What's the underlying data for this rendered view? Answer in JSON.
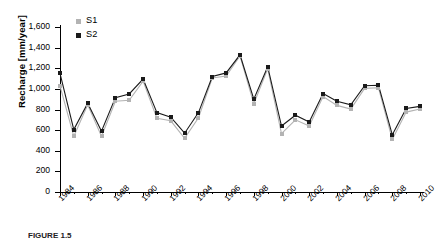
{
  "figure": {
    "y_axis_title": "Recharge [mm/year]",
    "caption": "FIGURE 1.5"
  },
  "legend": {
    "position": "top-left",
    "items": [
      {
        "label": "S1",
        "color": "#b3b3b3"
      },
      {
        "label": "S2",
        "color": "#1a1a1a"
      }
    ]
  },
  "chart_data": {
    "type": "line",
    "title": "",
    "xlabel": "",
    "ylabel": "Recharge [mm/year]",
    "ylim": [
      0,
      1600
    ],
    "yticks": [
      0,
      200,
      400,
      600,
      800,
      1000,
      1200,
      1400,
      1600
    ],
    "ytick_labels": [
      "0",
      "200",
      "400",
      "600",
      "800",
      "1,000",
      "1,200",
      "1,400",
      "1,600"
    ],
    "grid": false,
    "legend_position": "top-left",
    "x": [
      1984,
      1985,
      1986,
      1987,
      1988,
      1989,
      1990,
      1991,
      1992,
      1993,
      1994,
      1995,
      1996,
      1997,
      1998,
      1999,
      2000,
      2001,
      2002,
      2003,
      2004,
      2005,
      2006,
      2007,
      2008,
      2009,
      2010
    ],
    "xtick_labels": [
      "1984",
      "1986",
      "1988",
      "1990",
      "1992",
      "1994",
      "1996",
      "1998",
      "2000",
      "2002",
      "2004",
      "2006",
      "2008",
      "2010"
    ],
    "xtick_values": [
      1984,
      1986,
      1988,
      1990,
      1992,
      1994,
      1996,
      1998,
      2000,
      2002,
      2004,
      2006,
      2008,
      2010
    ],
    "series": [
      {
        "name": "S1",
        "color": "#b3b3b3",
        "marker": "square",
        "values": [
          1030,
          540,
          845,
          540,
          880,
          890,
          1075,
          715,
          690,
          520,
          720,
          1105,
          1125,
          1320,
          855,
          1195,
          565,
          700,
          640,
          925,
          840,
          805,
          1005,
          1010,
          510,
          775,
          805
        ]
      },
      {
        "name": "S2",
        "color": "#1a1a1a",
        "marker": "square",
        "values": [
          1150,
          605,
          860,
          590,
          915,
          950,
          1095,
          770,
          725,
          570,
          770,
          1120,
          1155,
          1330,
          900,
          1215,
          640,
          745,
          680,
          955,
          880,
          845,
          1030,
          1035,
          555,
          810,
          830
        ]
      }
    ]
  }
}
